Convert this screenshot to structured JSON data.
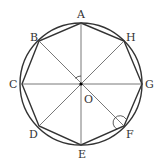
{
  "diagram": {
    "type": "regular-octagon-inscribed-in-circle",
    "center": {
      "label": "O",
      "x": 81,
      "y": 84
    },
    "radius": 61,
    "vertices": [
      {
        "label": "A",
        "x": 81,
        "y": 23,
        "lx": 77,
        "ly": 18
      },
      {
        "label": "H",
        "x": 124,
        "y": 41,
        "lx": 126,
        "ly": 41
      },
      {
        "label": "G",
        "x": 142,
        "y": 84,
        "lx": 145,
        "ly": 88
      },
      {
        "label": "F",
        "x": 124,
        "y": 126,
        "lx": 126,
        "ly": 138
      },
      {
        "label": "E",
        "x": 81,
        "y": 145,
        "lx": 78,
        "ly": 158
      },
      {
        "label": "D",
        "x": 39,
        "y": 126,
        "lx": 29,
        "ly": 138
      },
      {
        "label": "C",
        "x": 22,
        "y": 84,
        "lx": 9,
        "ly": 88
      },
      {
        "label": "B",
        "x": 39,
        "y": 41,
        "lx": 30,
        "ly": 41
      }
    ],
    "diagonals": [
      [
        "A",
        "E"
      ],
      [
        "B",
        "F"
      ],
      [
        "C",
        "G"
      ],
      [
        "D",
        "H"
      ]
    ],
    "angle_marks": [
      {
        "at": "O",
        "between": [
          "B",
          "A"
        ]
      },
      {
        "at": "F",
        "between": [
          "E",
          "G"
        ]
      }
    ],
    "colors": {
      "stroke": "#333333",
      "diagonal": "#555555"
    }
  }
}
